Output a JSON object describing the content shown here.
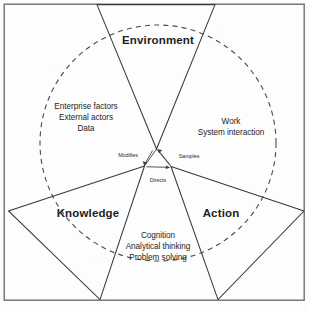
{
  "diagram": {
    "type": "venn-sector-triad",
    "colors": {
      "frame": "#6f6f6f",
      "sector_outline": "#3a3a3a",
      "dashed_boundary": "#4a4a4a",
      "text": "#1d1d1d",
      "background": "#fdfdfd"
    },
    "sectors": [
      {
        "key": "environment",
        "title": "Environment",
        "body_lines": [
          "Enterprise factors",
          "External actors",
          "Data"
        ]
      },
      {
        "key": "knowledge",
        "title": "Knowledge",
        "body_lines": []
      },
      {
        "key": "action",
        "title": "Action",
        "body_lines": [
          "Work",
          "System interaction"
        ]
      }
    ],
    "secondary_text_blocks": [
      {
        "key": "cognition-block",
        "lines": [
          "Cognition",
          "Analytical thinking",
          "Problem solving"
        ]
      }
    ],
    "flows": [
      {
        "key": "modifies",
        "label": "Modifies",
        "from": "knowledge",
        "to": "environment"
      },
      {
        "key": "samples",
        "label": "Samples",
        "from": "action",
        "to": "environment"
      },
      {
        "key": "directs",
        "label": "Directs",
        "from": "knowledge",
        "to": "action"
      }
    ]
  },
  "labels": {
    "environment_title": "Environment",
    "environment_line_1": "Enterprise factors",
    "environment_line_2": "External actors",
    "environment_line_3": "Data",
    "action_title": "Action",
    "action_line_1": "Work",
    "action_line_2": "System interaction",
    "knowledge_title": "Knowledge",
    "cognition_line_1": "Cognition",
    "cognition_line_2": "Analytical thinking",
    "cognition_line_3": "Problem solving",
    "flow_modifies": "Modifies",
    "flow_samples": "Samples",
    "flow_directs": "Directs"
  }
}
